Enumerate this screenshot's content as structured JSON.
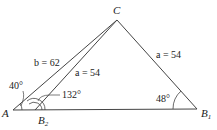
{
  "diagram": {
    "vertices": {
      "A": "A",
      "B1": "B",
      "B1_sub": "1",
      "B2": "B",
      "B2_sub": "2",
      "C": "C"
    },
    "sides": {
      "b_AC": "b = 62",
      "a_CB2": "a = 54",
      "a_CB1": "a = 54"
    },
    "angles": {
      "A": "40°",
      "B2_obtuse": "132°",
      "B1": "48°"
    },
    "colors": {
      "line": "#333333",
      "text": "#222222"
    }
  }
}
